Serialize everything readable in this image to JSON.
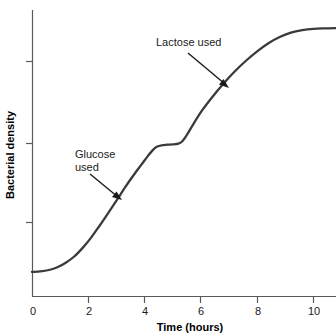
{
  "chart_data": {
    "type": "line",
    "title": "",
    "subtitle": "",
    "xlabel": "Time (hours)",
    "ylabel": "Bacterial density",
    "xlim": [
      0,
      10.8
    ],
    "ylim": [
      0,
      10
    ],
    "grid": false,
    "legend": "none",
    "xticks": [
      0,
      2,
      4,
      6,
      8,
      10
    ],
    "xtick_labels": [
      "0",
      "2",
      "4",
      "6",
      "8",
      "10"
    ],
    "yticks": [
      2.9,
      5.9,
      8.7
    ],
    "ytick_labels": [
      "",
      "",
      ""
    ],
    "series": [
      {
        "name": "Diauxic growth curve",
        "x": [
          0.0,
          0.3,
          0.6,
          0.9,
          1.2,
          1.5,
          1.8,
          2.1,
          2.4,
          2.7,
          3.0,
          3.3,
          3.6,
          3.9,
          4.1,
          4.3,
          4.45,
          4.6,
          4.8,
          5.0,
          5.2,
          5.35,
          5.5,
          5.7,
          6.0,
          6.4,
          6.8,
          7.2,
          7.6,
          8.0,
          8.4,
          8.8,
          9.2,
          9.6,
          10.0,
          10.4,
          10.8
        ],
        "y": [
          0.93,
          0.95,
          1.0,
          1.1,
          1.27,
          1.5,
          1.82,
          2.2,
          2.64,
          3.1,
          3.57,
          4.05,
          4.5,
          4.92,
          5.2,
          5.45,
          5.57,
          5.62,
          5.64,
          5.65,
          5.68,
          5.78,
          6.0,
          6.35,
          6.85,
          7.4,
          7.9,
          8.35,
          8.75,
          9.1,
          9.4,
          9.63,
          9.79,
          9.88,
          9.93,
          9.95,
          9.96
        ]
      }
    ],
    "annotations": [
      {
        "id": "lactose",
        "text": "Lactose used",
        "lines": [
          "Lactose used"
        ],
        "label_x": 156,
        "label_y": 46,
        "arrow_from": [
          188,
          53
        ],
        "arrow_to": [
          229,
          88
        ]
      },
      {
        "id": "glucose",
        "text": "Glucose used",
        "lines": [
          "Glucose",
          "used"
        ],
        "label_x": 75,
        "label_y": 158,
        "arrow_from": [
          90,
          174
        ],
        "arrow_to": [
          122,
          200
        ]
      }
    ],
    "colors": {
      "curve": "#3b3b3b",
      "axis": "#5a5a5a",
      "text": "#1a1a1a",
      "background": "#ffffff",
      "arrow": "#1a1a1a"
    }
  }
}
